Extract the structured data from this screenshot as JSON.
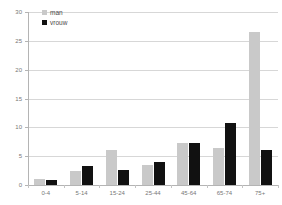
{
  "chart_data": {
    "type": "bar",
    "title": "",
    "xlabel": "",
    "ylabel": "",
    "ylim": [
      0,
      30
    ],
    "yticks": [
      0,
      5,
      10,
      15,
      20,
      25,
      30
    ],
    "grid": true,
    "legend_position": "top-left",
    "categories": [
      "0-4",
      "5-14",
      "15-24",
      "25-44",
      "45-64",
      "65-74",
      "75+"
    ],
    "series": [
      {
        "name": "man",
        "color": "#c9c9c9",
        "values": [
          1.1,
          2.5,
          6.0,
          3.5,
          7.3,
          6.5,
          26.5
        ]
      },
      {
        "name": "vrouw",
        "color": "#111111",
        "values": [
          0.8,
          3.3,
          2.6,
          4.0,
          7.3,
          10.7,
          6.0
        ]
      }
    ]
  },
  "legend": {
    "items": [
      {
        "label": "man",
        "swatch": "legend-swatch-male"
      },
      {
        "label": "vrouw",
        "swatch": "legend-swatch-female"
      }
    ]
  },
  "axis": {
    "y_tick_labels": [
      "30",
      "25",
      "20",
      "15",
      "10",
      "5",
      "0"
    ],
    "x_tick_labels": [
      "0-4",
      "5-14",
      "15-24",
      "25-44",
      "45-64",
      "65-74",
      "75+"
    ]
  }
}
